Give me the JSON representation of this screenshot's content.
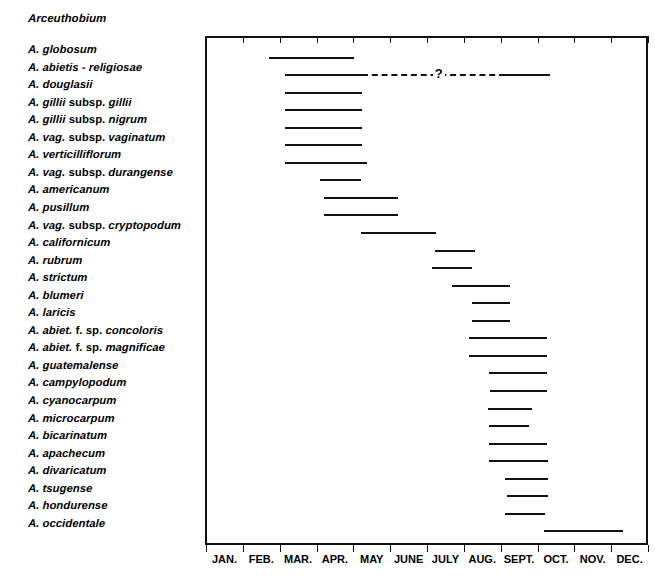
{
  "figure": {
    "genus_heading": "Arceuthobium",
    "axis": {
      "months": [
        "JAN.",
        "FEB.",
        "MAR.",
        "APR.",
        "MAY",
        "JUNE",
        "JULY",
        "AUG.",
        "SEPT.",
        "OCT.",
        "NOV.",
        "DEC."
      ],
      "uncertainty_marker": "?"
    }
  },
  "species_labels": [
    {
      "abbrev": "A. globosum"
    },
    {
      "abbrev": "A. abietis - religiosae"
    },
    {
      "abbrev": "A. douglasii"
    },
    {
      "abbrev": "A. gillii",
      "rank": "subsp.",
      "epithet": "gillii"
    },
    {
      "abbrev": "A. gillii",
      "rank": "subsp.",
      "epithet": "nigrum"
    },
    {
      "abbrev": "A. vag.",
      "rank": "subsp.",
      "epithet": "vaginatum"
    },
    {
      "abbrev": "A. verticilliflorum"
    },
    {
      "abbrev": "A. vag.",
      "rank": "subsp.",
      "epithet": "durangense"
    },
    {
      "abbrev": "A. americanum"
    },
    {
      "abbrev": "A. pusillum"
    },
    {
      "abbrev": "A. vag.",
      "rank": "subsp.",
      "epithet": "cryptopodum"
    },
    {
      "abbrev": "A. californicum"
    },
    {
      "abbrev": "A. rubrum"
    },
    {
      "abbrev": "A. strictum"
    },
    {
      "abbrev": "A. blumeri"
    },
    {
      "abbrev": "A. laricis"
    },
    {
      "abbrev": "A. abiet.",
      "rank": "f. sp.",
      "epithet": "concoloris"
    },
    {
      "abbrev": "A. abiet.",
      "rank": "f. sp.",
      "epithet": "magnificae"
    },
    {
      "abbrev": "A. guatemalense"
    },
    {
      "abbrev": "A. campylopodum"
    },
    {
      "abbrev": "A. cyanocarpum"
    },
    {
      "abbrev": "A. microcarpum"
    },
    {
      "abbrev": "A. bicarinatum"
    },
    {
      "abbrev": "A. apachecum"
    },
    {
      "abbrev": "A. divaricatum"
    },
    {
      "abbrev": "A. tsugense"
    },
    {
      "abbrev": "A. hondurense"
    },
    {
      "abbrev": "A. occidentale"
    }
  ],
  "chart_data": {
    "type": "bar",
    "title": "Arceuthobium",
    "xlabel": "",
    "ylabel": "",
    "orientation": "horizontal-ranges",
    "grid": false,
    "legend": false,
    "x_axis": {
      "tick_labels": [
        "JAN.",
        "FEB.",
        "MAR.",
        "APR.",
        "MAY",
        "JUNE",
        "JULY",
        "AUG.",
        "SEPT.",
        "OCT.",
        "NOV.",
        "DEC."
      ],
      "xlim_months": [
        0,
        12
      ],
      "units": "month of year (seed dispersal period)"
    },
    "categories": [
      "A. globosum",
      "A. abietis - religiosae",
      "A. douglasii",
      "A. gillii subsp. gillii",
      "A. gillii subsp. nigrum",
      "A. vag. subsp. vaginatum",
      "A. verticilliflorum",
      "A. vag. subsp. durangense",
      "A. americanum",
      "A. pusillum",
      "A. vag. subsp. cryptopodum",
      "A. californicum",
      "A. rubrum",
      "A. strictum",
      "A. blumeri",
      "A. laricis",
      "A. abiet. f. sp. concoloris",
      "A. abiet. f. sp. magnificae",
      "A. guatemalense",
      "A. campylopodum",
      "A. cyanocarpum",
      "A. microcarpum",
      "A. bicarinatum",
      "A. apachecum",
      "A. divaricatum",
      "A. tsugense",
      "A. hondurense",
      "A. occidentale"
    ],
    "ranges": [
      {
        "category": "A. globosum",
        "start_month": 1.66,
        "end_month": 3.97,
        "style": "solid"
      },
      {
        "category": "A. abietis - religiosae",
        "segments": [
          {
            "start_month": 2.09,
            "end_month": 4.19,
            "style": "solid"
          },
          {
            "start_month": 4.19,
            "end_month": 8.07,
            "style": "dashed"
          },
          {
            "start_month": 8.07,
            "end_month": 9.29,
            "style": "solid"
          }
        ],
        "uncertain_at_month": 6.1,
        "uncertain_marker": "?"
      },
      {
        "category": "A. douglasii",
        "start_month": 2.09,
        "end_month": 4.19,
        "style": "solid"
      },
      {
        "category": "A. gillii subsp. gillii",
        "start_month": 2.09,
        "end_month": 4.19,
        "style": "solid"
      },
      {
        "category": "A. gillii subsp. nigrum",
        "start_month": 2.09,
        "end_month": 4.19,
        "style": "solid"
      },
      {
        "category": "A. vag. subsp. vaginatum",
        "start_month": 2.09,
        "end_month": 4.19,
        "style": "solid"
      },
      {
        "category": "A. verticilliflorum",
        "start_month": 2.09,
        "end_month": 4.32,
        "style": "solid"
      },
      {
        "category": "A. vag. subsp. durangense",
        "start_month": 3.04,
        "end_month": 4.16,
        "style": "solid"
      },
      {
        "category": "A. americanum",
        "start_month": 3.15,
        "end_month": 5.16,
        "style": "solid"
      },
      {
        "category": "A. pusillum",
        "start_month": 3.15,
        "end_month": 5.16,
        "style": "solid"
      },
      {
        "category": "A. vag. subsp. cryptopodum",
        "start_month": 4.16,
        "end_month": 6.2,
        "style": "solid"
      },
      {
        "category": "A. californicum",
        "start_month": 6.17,
        "end_month": 7.26,
        "style": "solid"
      },
      {
        "category": "A. rubrum",
        "start_month": 6.09,
        "end_month": 7.17,
        "style": "solid"
      },
      {
        "category": "A. strictum",
        "start_month": 6.63,
        "end_month": 8.21,
        "style": "solid"
      },
      {
        "category": "A. blumeri",
        "start_month": 7.17,
        "end_month": 8.21,
        "style": "solid"
      },
      {
        "category": "A. laricis",
        "start_month": 7.17,
        "end_month": 8.21,
        "style": "solid"
      },
      {
        "category": "A. abiet. f. sp. concoloris",
        "start_month": 7.09,
        "end_month": 9.21,
        "style": "solid"
      },
      {
        "category": "A. abiet. f. sp. magnificae",
        "start_month": 7.09,
        "end_month": 9.21,
        "style": "solid"
      },
      {
        "category": "A. guatemalense",
        "start_month": 7.64,
        "end_month": 9.21,
        "style": "solid"
      },
      {
        "category": "A. campylopodum",
        "start_month": 7.66,
        "end_month": 9.21,
        "style": "solid"
      },
      {
        "category": "A. cyanocarpum",
        "start_month": 7.61,
        "end_month": 8.81,
        "style": "solid"
      },
      {
        "category": "A. microcarpum",
        "start_month": 7.64,
        "end_month": 8.72,
        "style": "solid"
      },
      {
        "category": "A. bicarinatum",
        "start_month": 7.64,
        "end_month": 9.21,
        "style": "solid"
      },
      {
        "category": "A. apachecum",
        "start_month": 7.64,
        "end_month": 9.24,
        "style": "solid"
      },
      {
        "category": "A. divaricatum",
        "start_month": 8.05,
        "end_month": 9.24,
        "style": "solid"
      },
      {
        "category": "A. tsugense",
        "start_month": 8.13,
        "end_month": 9.24,
        "style": "solid"
      },
      {
        "category": "A. hondurense",
        "start_month": 8.05,
        "end_month": 9.16,
        "style": "solid"
      },
      {
        "category": "A. occidentale",
        "start_month": 9.13,
        "end_month": 11.28,
        "style": "solid"
      }
    ]
  }
}
